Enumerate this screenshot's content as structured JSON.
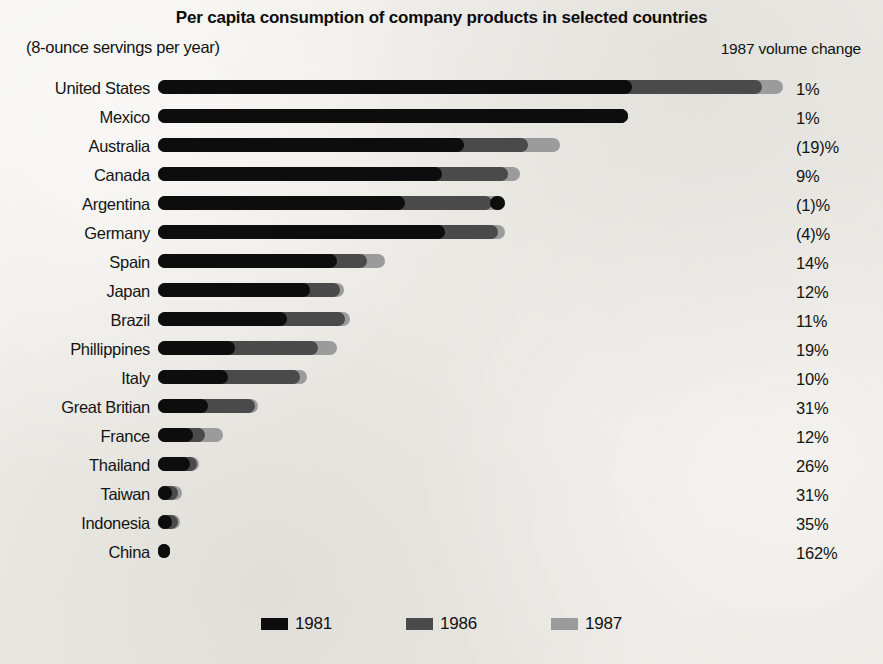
{
  "title": "Per capita consumption of company products in selected countries",
  "units_note": "(8-ounce servings per year)",
  "volume_change_header": "1987 volume change",
  "colors": {
    "y1981": "#0d0d0d",
    "y1986": "#4a4a4a",
    "y1987": "#9b9b9b",
    "paper": "#efeeea",
    "text": "#141414"
  },
  "legend": {
    "position": "bottom-center",
    "entries": [
      {
        "label": "1981",
        "color": "#0d0d0d"
      },
      {
        "label": "1986",
        "color": "#4a4a4a"
      },
      {
        "label": "1987",
        "color": "#9b9b9b"
      }
    ]
  },
  "chart_data": {
    "type": "bar",
    "orientation": "horizontal",
    "title": "Per capita consumption of company products in selected countries",
    "subtitle": "(8-ounce servings per year)",
    "xlabel": "8-ounce servings per year",
    "ylabel": "",
    "grid": false,
    "legend_position": "bottom-center",
    "series_names": [
      "1981",
      "1986",
      "1987"
    ],
    "categories": [
      "United States",
      "Mexico",
      "Australia",
      "Canada",
      "Argentina",
      "Germany",
      "Spain",
      "Japan",
      "Brazil",
      "Phillippines",
      "Italy",
      "Great Britian",
      "France",
      "Thailand",
      "Taiwan",
      "Indonesia",
      "China"
    ],
    "value_unit": "8-ounce servings per year",
    "series": [
      {
        "name": "1981",
        "color": "#0d0d0d",
        "values": [
          297,
          292,
          245,
          228,
          198,
          230,
          144,
          122,
          104,
          62,
          35,
          25,
          17,
          15,
          7,
          5,
          2
        ]
      },
      {
        "name": "1986",
        "color": "#4a4a4a",
        "values": [
          345,
          280,
          296,
          262,
          190,
          274,
          168,
          146,
          132,
          118,
          100,
          75,
          48,
          32,
          19,
          13,
          3
        ]
      },
      {
        "name": "1987",
        "color": "#9b9b9b",
        "values": [
          352,
          288,
          312,
          268,
          205,
          268,
          182,
          150,
          136,
          129,
          105,
          80,
          55,
          36,
          22,
          15,
          4
        ]
      }
    ],
    "annotations_column": {
      "header": "1987 volume change",
      "values": [
        "1%",
        "1%",
        "(19)%",
        "9%",
        "(1)%",
        "(4)%",
        "14%",
        "12%",
        "11%",
        "19%",
        "10%",
        "31%",
        "12%",
        "26%",
        "31%",
        "35%",
        "162%"
      ]
    }
  },
  "rows": [
    {
      "country": "United States",
      "pct": "1%",
      "seg1981_px": 474,
      "seg1986_px": 604,
      "seg1987_px": 625,
      "tip": "none"
    },
    {
      "country": "Mexico",
      "pct": "1%",
      "seg1981_px": 470,
      "seg1986_px": 455,
      "seg1987_px": 470,
      "tip": "1981"
    },
    {
      "country": "Australia",
      "pct": "(19)%",
      "seg1981_px": 306,
      "seg1986_px": 370,
      "seg1987_px": 402,
      "tip": "none"
    },
    {
      "country": "Canada",
      "pct": "9%",
      "seg1981_px": 284,
      "seg1986_px": 350,
      "seg1987_px": 362,
      "tip": "none"
    },
    {
      "country": "Argentina",
      "pct": "(1)%",
      "seg1981_px": 247,
      "seg1986_px": 334,
      "seg1987_px": 347,
      "tip": "1981"
    },
    {
      "country": "Germany",
      "pct": "(4)%",
      "seg1981_px": 287,
      "seg1986_px": 340,
      "seg1987_px": 347,
      "tip": "none"
    },
    {
      "country": "Spain",
      "pct": "14%",
      "seg1981_px": 179,
      "seg1986_px": 209,
      "seg1987_px": 227,
      "tip": "none"
    },
    {
      "country": "Japan",
      "pct": "12%",
      "seg1981_px": 152,
      "seg1986_px": 182,
      "seg1987_px": 186,
      "tip": "none"
    },
    {
      "country": "Brazil",
      "pct": "11%",
      "seg1981_px": 129,
      "seg1986_px": 187,
      "seg1987_px": 192,
      "tip": "none"
    },
    {
      "country": "Phillippines",
      "pct": "19%",
      "seg1981_px": 77,
      "seg1986_px": 160,
      "seg1987_px": 179,
      "tip": "none"
    },
    {
      "country": "Italy",
      "pct": "10%",
      "seg1981_px": 70,
      "seg1986_px": 142,
      "seg1987_px": 149,
      "tip": "none"
    },
    {
      "country": "Great Britian",
      "pct": "31%",
      "seg1981_px": 50,
      "seg1986_px": 97,
      "seg1987_px": 100,
      "tip": "none"
    },
    {
      "country": "France",
      "pct": "12%",
      "seg1981_px": 35,
      "seg1986_px": 47,
      "seg1987_px": 65,
      "tip": "none"
    },
    {
      "country": "Thailand",
      "pct": "26%",
      "seg1981_px": 32,
      "seg1986_px": 39,
      "seg1987_px": 41,
      "tip": "none"
    },
    {
      "country": "Taiwan",
      "pct": "31%",
      "seg1981_px": 14,
      "seg1986_px": 20,
      "seg1987_px": 24,
      "tip": "none"
    },
    {
      "country": "Indonesia",
      "pct": "35%",
      "seg1981_px": 14,
      "seg1986_px": 20,
      "seg1987_px": 22,
      "tip": "none"
    },
    {
      "country": "China",
      "pct": "162%",
      "seg1981_px": 12,
      "seg1986_px": 12,
      "seg1987_px": 12,
      "tip": "none"
    }
  ]
}
